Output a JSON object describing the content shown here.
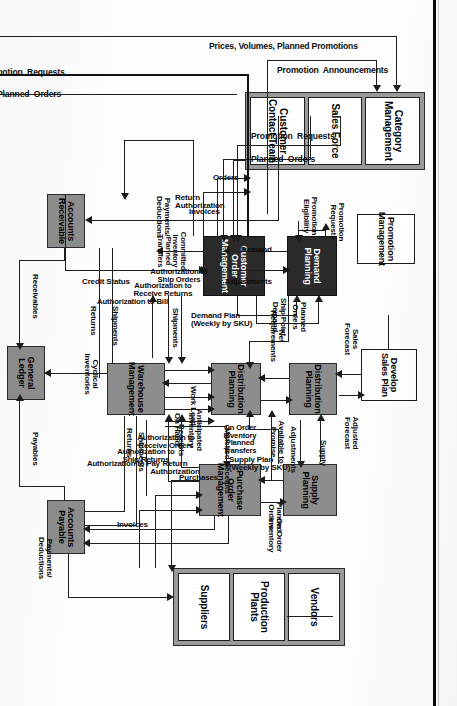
{
  "diagram": {
    "orientation": "rotated-90-clockwise",
    "colors": {
      "process_grey": "#8d8d8d",
      "process_dark": "#2a2a2a",
      "external_white": "#ffffff",
      "line": "#1e1e1e",
      "page_edge": "#0b0b0b"
    },
    "nodes": {
      "category_group": {
        "kind": "external-group",
        "cells": [
          "Category\nManagement",
          "Sales Force",
          "Customer\nContact Team"
        ]
      },
      "vendor_group": {
        "kind": "external-group",
        "cells": [
          "Vendors",
          "Production\nPlants",
          "Suppliers"
        ]
      },
      "promotion_management": "Promotion\nManagement",
      "develop_sales_plan": "Develop\nSales Plan",
      "demand_planning": "Demand\nPlanning",
      "customer_order_management": "Customer\nOrder\nManagement",
      "distribution_planning_left": "Distribution\nPlanning",
      "distribution_planning_right": "Distribution\nPlanning",
      "supply_planning": "Supply\nPlanning",
      "purchase_order_management": "Purchase\nOrder\nManagement",
      "warehouse_management": "Warehouse\nManagement",
      "accounts_receivable": "Accounts\nReceivable",
      "accounts_payable": "Accounts\nPayable",
      "general_ledger": "General\nLedger"
    },
    "flow_labels": {
      "prices_volumes": "Prices, Volumes, Planned Promotions",
      "promotion_announcements": "Promotion  Announcements",
      "promotion_requests_top": "Promotion  Requests",
      "planned_orders_top": "Planned  Orders",
      "promotion_requests_pm": "Promotion\nRequests",
      "promotion_eligibility": "Promotion\nEligibility",
      "orders": "Orders",
      "return_authorization": "Return\nAuthorization",
      "invoices": "Invoices",
      "payments_deductions_ar": "Payments/\nDeductions",
      "credit_status": "Credit Status",
      "planned_orders_dp_com": "Planned\nOrders",
      "ship_point_demand": "Ship Point\nDemand",
      "demand": "Demand",
      "adjustments_dp": "Adjustments",
      "demand_plan": "Demand Plan\n(Weekly by SKU)",
      "committed_inventory": "Committed\nInventory\nPlanned\nTransfers",
      "net_requirements": "Net\nRequirements",
      "available_to_promise": "Available to\nPromise",
      "sales_forecast": "Sales\nForecast",
      "adjusted_forecast": "Adjusted\nForecast",
      "supply": "Supply",
      "adjustments_sp": "Adjustments",
      "supply_plan": "Supply Plan\n(Weekly by SKU)",
      "on_order_inv_planned": "On Order\nInventory\nPlanned\nTransfers",
      "planned_orders_sp": "Planned\nOrders",
      "on_order_inventory": "On Order\nInventory",
      "matched_receipts": "Matched Receipts",
      "purchases": "Purchases",
      "return_authorization_v": "Return\nAuthorization",
      "invoices_v": "Invoices",
      "shipments_wh": "Shipments",
      "work_load": "Work Load",
      "anticipated_inventory": "Anticipated\nInventory",
      "on_hand": "On Hand",
      "receipts": "Receipts",
      "auth_ship_orders": "Authorization to\nShip Orders",
      "auth_receive_returns": "Authorization to\nReceive Returns",
      "auth_to_bill": "Authorization to Bill",
      "auth_receive_orders": "Authorization to\nReceive Orders",
      "auth_ship_returns": "Authorization to\nShip Returns",
      "auth_to_pay": "Authorization to Pay",
      "cyclical_inventories": "Cyclical\nInventories",
      "shipments_ar": "Shipments",
      "returns_ar": "Returns",
      "receivables": "Receivables",
      "returns_ap": "Returns",
      "shipments_ap": "Shipments",
      "payables": "Payables",
      "payments_deductions_ap": "Payments/\nDeductions",
      "promotion_requests_bottom": "Promotion  Requests",
      "planned_orders_bottom": "Planned  Orders"
    }
  }
}
